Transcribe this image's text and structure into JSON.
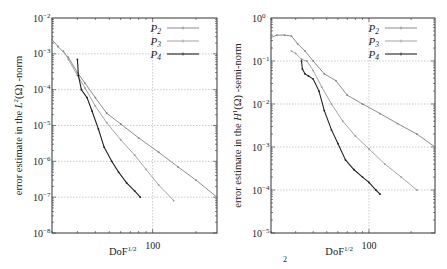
{
  "chart_data": [
    {
      "type": "line",
      "panel": "left",
      "title": "",
      "xlabel": "DoF^{1/2}",
      "ylabel": "error estimate in the L^2(Ω) -norm",
      "xscale": "log",
      "yscale": "log",
      "xlim": [
        20,
        280
      ],
      "ylim": [
        1e-08,
        0.01
      ],
      "x_tick_labels": [
        "100"
      ],
      "y_tick_labels": [
        "10^-2",
        "10^-3",
        "10^-4",
        "10^-5",
        "10^-6",
        "10^-7",
        "10^-8"
      ],
      "grid": true,
      "legend_position": "upper right",
      "series": [
        {
          "name": "P2",
          "color": "#808080",
          "x": [
            20,
            22,
            26,
            30,
            34,
            40,
            48,
            60,
            80,
            110,
            150,
            200,
            280
          ],
          "y": [
            0.0025,
            0.0016,
            0.0008,
            0.0003,
            0.00015,
            6e-05,
            2.2e-05,
            1.1e-05,
            4.5e-06,
            1.8e-06,
            7e-07,
            3e-07,
            1e-07
          ]
        },
        {
          "name": "P3",
          "color": "#9a9a9a",
          "x": [
            24,
            26,
            30,
            34,
            40,
            48,
            60,
            75,
            90,
            110,
            140
          ],
          "y": [
            0.0012,
            0.0007,
            0.00025,
            0.00011,
            3.5e-05,
            1.2e-05,
            4e-06,
            1.5e-06,
            6e-07,
            2.2e-07,
            8e-08
          ]
        },
        {
          "name": "P4",
          "color": "#222222",
          "x": [
            30,
            30.5,
            32,
            35,
            38,
            42,
            46,
            52,
            58,
            66,
            75,
            82
          ],
          "y": [
            0.0007,
            0.00025,
            0.0001,
            6e-05,
            2.5e-05,
            8e-06,
            2.5e-06,
            1e-06,
            5e-07,
            2.5e-07,
            1.5e-07,
            1e-07
          ]
        }
      ]
    },
    {
      "type": "line",
      "panel": "right",
      "title": "",
      "xlabel": "DoF^{1/2}",
      "ylabel": "error estimate in the H^1(Ω) -semi-norm",
      "xscale": "log",
      "yscale": "log",
      "xlim": [
        20,
        296
      ],
      "ylim": [
        1e-05,
        1.0
      ],
      "x_tick_labels": [
        "100"
      ],
      "y_tick_labels": [
        "10^0",
        "10^-1",
        "10^-2",
        "10^-3",
        "10^-4",
        "10^-5"
      ],
      "grid": true,
      "legend_position": "upper right",
      "series": [
        {
          "name": "P2",
          "color": "#808080",
          "x": [
            20,
            22,
            25,
            28,
            31,
            35,
            40,
            48,
            58,
            70,
            90,
            120,
            160,
            220,
            296
          ],
          "y": [
            0.35,
            0.4,
            0.4,
            0.38,
            0.25,
            0.17,
            0.1,
            0.05,
            0.035,
            0.016,
            0.01,
            0.006,
            0.0035,
            0.002,
            0.001
          ]
        },
        {
          "name": "P3",
          "color": "#9a9a9a",
          "x": [
            28,
            30,
            33,
            36,
            40,
            46,
            54,
            65,
            80,
            100,
            130,
            170,
            220
          ],
          "y": [
            0.17,
            0.15,
            0.11,
            0.1,
            0.06,
            0.025,
            0.01,
            0.004,
            0.0018,
            0.0009,
            0.0004,
            0.0002,
            0.0001
          ]
        },
        {
          "name": "P4",
          "color": "#222222",
          "x": [
            33,
            33.5,
            35,
            37,
            40,
            44,
            48,
            54,
            60,
            68,
            78,
            90,
            100,
            112,
            120
          ],
          "y": [
            0.1,
            0.065,
            0.05,
            0.045,
            0.038,
            0.02,
            0.007,
            0.0025,
            0.0012,
            0.0005,
            0.0003,
            0.0002,
            0.00015,
            0.0001,
            8e-05
          ]
        }
      ]
    }
  ],
  "caption_fragment": "2"
}
